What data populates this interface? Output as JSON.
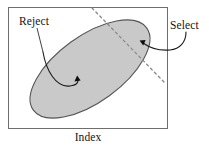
{
  "figure": {
    "title_bottom": "Index",
    "annotations": {
      "reject": "Reject",
      "select": "Select"
    },
    "colors": {
      "ellipse_fill": "#c9c9c9",
      "ellipse_stroke": "#555555",
      "box_stroke": "#6e6e6e",
      "dashed_line": "#8a8a8a",
      "arrow": "#1a1a1a",
      "text": "#141414",
      "background": "#ffffff"
    },
    "shapes": {
      "frame": {
        "x": 8,
        "y": 7,
        "width": 160,
        "height": 122
      },
      "ellipse": {
        "cx": 90,
        "cy": 69,
        "rx": 70,
        "ry": 33,
        "rotation_deg": -36
      },
      "divider_line": {
        "x1": 92,
        "y1": 8,
        "x2": 164,
        "y2": 82,
        "style": "dashed"
      },
      "reject_arrow_target": {
        "x": 77,
        "y": 79
      },
      "select_arrow_target": {
        "x": 141,
        "y": 42
      }
    }
  }
}
